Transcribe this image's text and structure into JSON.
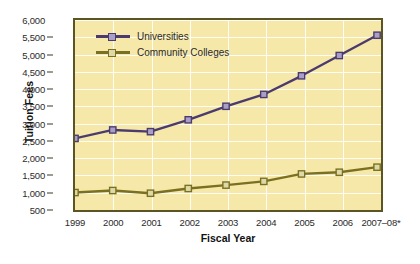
{
  "chart_data": {
    "type": "line",
    "title": "",
    "xlabel": "Fiscal Year",
    "ylabel": "Tuition Fees",
    "categories": [
      "1999",
      "2000",
      "2001",
      "2002",
      "2003",
      "2004",
      "2005",
      "2006",
      "2007–08*"
    ],
    "ylim": [
      500,
      6000
    ],
    "ytick_step": 500,
    "ytick_labels": [
      "6,000",
      "5,500",
      "5,000",
      "4,500",
      "4,000",
      "3,500",
      "3,000",
      "2,500",
      "2,000",
      "1,500",
      "1,000",
      "500"
    ],
    "grid": true,
    "legend_position": "top-left",
    "series": [
      {
        "name": "Universities",
        "color": "#4b3a6e",
        "marker_fill": "#a99ec6",
        "values": [
          2500,
          2750,
          2700,
          3050,
          3450,
          3800,
          4350,
          4950,
          5550
        ]
      },
      {
        "name": "Community Colleges",
        "color": "#7a7020",
        "marker_fill": "#ddd9a8",
        "values": [
          900,
          960,
          880,
          1020,
          1120,
          1230,
          1450,
          1500,
          1650
        ]
      }
    ]
  },
  "colors": {
    "plot_background": "#f6e8a9",
    "plot_border": "#5c5422",
    "gridline": "#fdfdf5",
    "page_background": "#ffffff",
    "universities": "#4b3a6e",
    "community_colleges": "#7a7020"
  }
}
